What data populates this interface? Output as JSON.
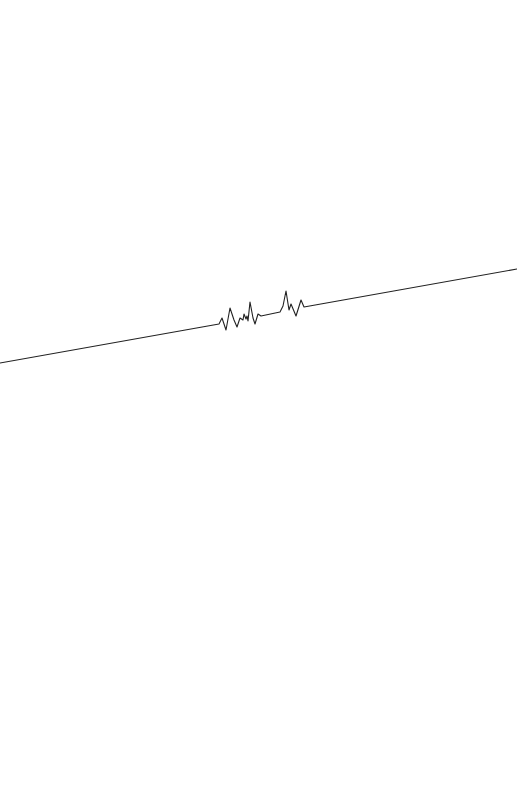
{
  "figure": {
    "background": "#ffffff",
    "stroke_color": "#222222",
    "stroke_width": 1.1,
    "points": [
      [
        0,
        363
      ],
      [
        219,
        324
      ],
      [
        222,
        318
      ],
      [
        226,
        330
      ],
      [
        230,
        308
      ],
      [
        234,
        320
      ],
      [
        237,
        327
      ],
      [
        240,
        318
      ],
      [
        243,
        320
      ],
      [
        244,
        314
      ],
      [
        246,
        319
      ],
      [
        247,
        316
      ],
      [
        248,
        321
      ],
      [
        250,
        302
      ],
      [
        253,
        318
      ],
      [
        255,
        324
      ],
      [
        258,
        314
      ],
      [
        261,
        316
      ],
      [
        280,
        312
      ],
      [
        283,
        306
      ],
      [
        286,
        291
      ],
      [
        289,
        310
      ],
      [
        291,
        304
      ],
      [
        296,
        316
      ],
      [
        301,
        300
      ],
      [
        304,
        307
      ],
      [
        517,
        269
      ]
    ]
  }
}
